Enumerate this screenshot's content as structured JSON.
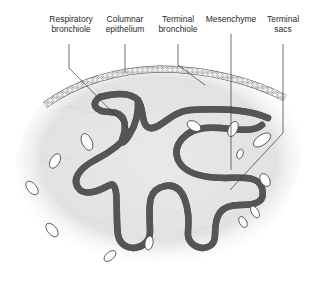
{
  "figure": {
    "type": "anatomical-diagram",
    "colors": {
      "background": "#ffffff",
      "mesenchyme": "#e6e6e6",
      "epithelium_outline": "#555555",
      "leader_line": "#333333",
      "text": "#2a2a2a"
    }
  },
  "labels": [
    {
      "id": "respiratory-bronchiole",
      "text": "Respiratory\nbronchiole"
    },
    {
      "id": "columnar-epithelium",
      "text": "Columnar\nepithelium"
    },
    {
      "id": "terminal-bronchiole",
      "text": "Terminal\nbronchiole"
    },
    {
      "id": "mesenchyme",
      "text": "Mesenchyme"
    },
    {
      "id": "terminal-sacs",
      "text": "Terminal\nsacs"
    }
  ]
}
